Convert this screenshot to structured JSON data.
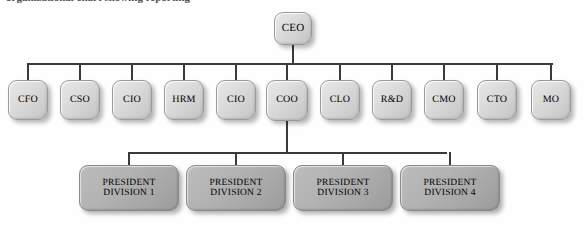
{
  "chart_data": {
    "type": "diagram",
    "title": "Organizational Chart",
    "root": "CEO",
    "levels": 3
  },
  "page": {
    "title_remnant": "organizational chart showing reporting"
  },
  "chart": {
    "root": {
      "id": "ceo",
      "label": "CEO",
      "x": 274,
      "y": 12,
      "w": 38,
      "h": 33
    },
    "executive_bus": {
      "y": 63,
      "x_start": 27,
      "x_end": 553
    },
    "executives": [
      {
        "id": "cfo",
        "label": "CFO",
        "x": 8,
        "y": 80,
        "w": 40,
        "h": 40
      },
      {
        "id": "cso",
        "label": "CSO",
        "x": 60,
        "y": 80,
        "w": 40,
        "h": 40
      },
      {
        "id": "cio-1",
        "label": "CIO",
        "x": 112,
        "y": 80,
        "w": 40,
        "h": 40
      },
      {
        "id": "hrm",
        "label": "HRM",
        "x": 164,
        "y": 80,
        "w": 40,
        "h": 40
      },
      {
        "id": "cio-2",
        "label": "CIO",
        "x": 216,
        "y": 80,
        "w": 40,
        "h": 40
      },
      {
        "id": "coo",
        "label": "COO",
        "x": 266,
        "y": 80,
        "w": 42,
        "h": 41
      },
      {
        "id": "clo",
        "label": "CLO",
        "x": 320,
        "y": 80,
        "w": 40,
        "h": 40
      },
      {
        "id": "rnd",
        "label": "R&D",
        "x": 372,
        "y": 80,
        "w": 40,
        "h": 40
      },
      {
        "id": "cmo",
        "label": "CMO",
        "x": 424,
        "y": 80,
        "w": 40,
        "h": 40
      },
      {
        "id": "cto",
        "label": "CTO",
        "x": 477,
        "y": 80,
        "w": 40,
        "h": 40
      },
      {
        "id": "mo",
        "label": "MO",
        "x": 531,
        "y": 80,
        "w": 40,
        "h": 40
      }
    ],
    "division_bus": {
      "y": 152,
      "x_start": 128,
      "x_end": 447
    },
    "divisions": [
      {
        "id": "president-division-1",
        "label": "PRESIDENT\nDIVISION 1",
        "line1": "PRESIDENT",
        "line2": "DIVISION 1",
        "x": 79,
        "y": 165,
        "w": 100,
        "h": 46
      },
      {
        "id": "president-division-2",
        "label": "PRESIDENT\nDIVISION 2",
        "line1": "PRESIDENT",
        "line2": "DIVISION 2",
        "x": 186,
        "y": 165,
        "w": 100,
        "h": 46
      },
      {
        "id": "president-division-3",
        "label": "PRESIDENT\nDIVISION 3",
        "line1": "PRESIDENT",
        "line2": "DIVISION 3",
        "x": 293,
        "y": 165,
        "w": 100,
        "h": 46
      },
      {
        "id": "president-division-4",
        "label": "PRESIDENT\nDIVISION 4",
        "line1": "PRESIDENT",
        "line2": "DIVISION 4",
        "x": 400,
        "y": 165,
        "w": 100,
        "h": 46
      }
    ]
  },
  "colors": {
    "line": "#3a3a3a",
    "node_light_top": "#e8e8e8",
    "node_light_bottom": "#c2c2c2",
    "node_dark_top": "#bcbcbc",
    "node_dark_bottom": "#9b9b9b",
    "border": "#9a9a9a",
    "text": "#000000",
    "background": "#ffffff"
  }
}
